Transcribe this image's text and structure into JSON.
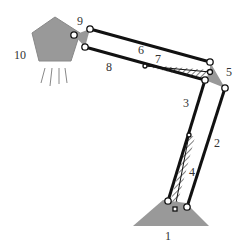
{
  "diagram": {
    "colors": {
      "body_fill": "#999999",
      "link": "#111111",
      "label": "#333333"
    },
    "labels": [
      {
        "id": "1",
        "text": "1",
        "x": 165,
        "y": 230
      },
      {
        "id": "2",
        "text": "2",
        "x": 214,
        "y": 137
      },
      {
        "id": "3",
        "text": "3",
        "x": 183,
        "y": 97
      },
      {
        "id": "4",
        "text": "4",
        "x": 189,
        "y": 166
      },
      {
        "id": "5",
        "text": "5",
        "x": 226,
        "y": 66
      },
      {
        "id": "6",
        "text": "6",
        "x": 138,
        "y": 44
      },
      {
        "id": "7",
        "text": "7",
        "x": 155,
        "y": 53
      },
      {
        "id": "8",
        "text": "8",
        "x": 106,
        "y": 61
      },
      {
        "id": "9",
        "text": "9",
        "x": 77,
        "y": 15
      },
      {
        "id": "10",
        "text": "10",
        "x": 14,
        "y": 49
      }
    ]
  }
}
